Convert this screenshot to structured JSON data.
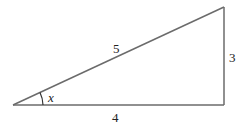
{
  "diagram": {
    "type": "right-triangle",
    "line_color": "#6b6b6b",
    "text_color": "#222222",
    "vertices": {
      "left": [
        13,
        105
      ],
      "bottom_right": [
        224,
        105
      ],
      "top_right": [
        224,
        7
      ]
    },
    "labels": {
      "hypotenuse": "5",
      "vertical_leg": "3",
      "base": "4",
      "angle": "x"
    }
  }
}
